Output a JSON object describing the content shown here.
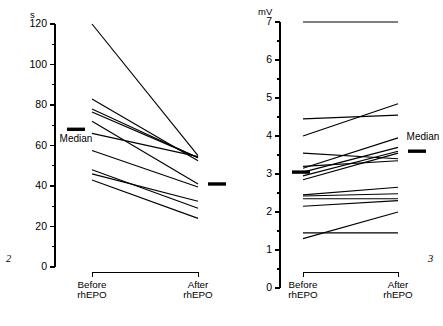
{
  "figure": {
    "panels": [
      {
        "id": "panel-left",
        "figure_number": "2",
        "unit_label": "s",
        "median_label_before": "Median",
        "median_label_after": "",
        "category_before_line1": "Before",
        "category_before_line2": "rhEPO",
        "category_after_line1": "After",
        "category_after_line2": "rhEPO"
      },
      {
        "id": "panel-right",
        "figure_number": "3",
        "unit_label": "mV",
        "median_label_before": "",
        "median_label_after": "Median",
        "category_before_line1": "Before",
        "category_before_line2": "rhEPO",
        "category_after_line1": "After",
        "category_after_line2": "rhEPO"
      }
    ]
  },
  "chart_data": [
    {
      "type": "line",
      "id": "panel-left",
      "title": "",
      "figure_number": "2",
      "xlabel": "",
      "ylabel": "s",
      "categories": [
        "Before rhEPO",
        "After rhEPO"
      ],
      "ylim": [
        0,
        120
      ],
      "yticks": [
        0,
        20,
        40,
        60,
        80,
        100,
        120
      ],
      "ytick_labels": [
        "0",
        "20",
        "40",
        "60",
        "80",
        "100",
        "120"
      ],
      "minor_tick_step": 10,
      "grid": false,
      "legend": "none",
      "series": [
        {
          "name": "subject-1",
          "values": [
            120.0,
            55.0
          ]
        },
        {
          "name": "subject-2",
          "values": [
            83.0,
            52.5
          ]
        },
        {
          "name": "subject-3",
          "values": [
            78.0,
            54.0
          ]
        },
        {
          "name": "subject-4",
          "values": [
            76.5,
            54.0
          ]
        },
        {
          "name": "subject-5",
          "values": [
            72.0,
            41.0
          ]
        },
        {
          "name": "subject-6",
          "values": [
            66.0,
            54.5
          ]
        },
        {
          "name": "subject-7",
          "values": [
            57.5,
            39.5
          ]
        },
        {
          "name": "subject-8",
          "values": [
            48.0,
            29.0
          ]
        },
        {
          "name": "subject-9",
          "values": [
            46.0,
            32.5
          ]
        },
        {
          "name": "subject-10",
          "values": [
            43.0,
            24.0
          ]
        }
      ],
      "medians": {
        "before": 68.0,
        "after": 41.0
      },
      "annotations": [
        {
          "text": "Median",
          "at": "before",
          "value": 68.0
        },
        {
          "text": "s",
          "at": "axis-unit"
        }
      ]
    },
    {
      "type": "line",
      "id": "panel-right",
      "title": "",
      "figure_number": "3",
      "xlabel": "",
      "ylabel": "mV",
      "categories": [
        "Before rhEPO",
        "After rhEPO"
      ],
      "ylim": [
        0,
        7
      ],
      "yticks": [
        0,
        1,
        2,
        3,
        4,
        5,
        6,
        7
      ],
      "ytick_labels": [
        "0",
        "1",
        "2",
        "3",
        "4",
        "5",
        "6",
        "7"
      ],
      "minor_tick_step": 0.5,
      "grid": false,
      "legend": "none",
      "series": [
        {
          "name": "subject-1",
          "values": [
            7.0,
            7.0
          ]
        },
        {
          "name": "subject-2",
          "values": [
            4.45,
            4.55
          ]
        },
        {
          "name": "subject-3",
          "values": [
            4.0,
            4.85
          ]
        },
        {
          "name": "subject-4",
          "values": [
            3.55,
            3.4
          ]
        },
        {
          "name": "subject-5",
          "values": [
            3.15,
            3.95
          ]
        },
        {
          "name": "subject-6",
          "values": [
            3.05,
            3.7
          ]
        },
        {
          "name": "subject-7",
          "values": [
            2.95,
            3.6
          ]
        },
        {
          "name": "subject-8",
          "values": [
            2.85,
            3.55
          ]
        },
        {
          "name": "subject-9",
          "values": [
            3.2,
            3.35
          ]
        },
        {
          "name": "subject-10",
          "values": [
            2.45,
            2.65
          ]
        },
        {
          "name": "subject-11",
          "values": [
            2.42,
            2.48
          ]
        },
        {
          "name": "subject-12",
          "values": [
            2.35,
            2.35
          ]
        },
        {
          "name": "subject-13",
          "values": [
            2.15,
            2.3
          ]
        },
        {
          "name": "subject-14",
          "values": [
            1.45,
            1.45
          ]
        },
        {
          "name": "subject-15",
          "values": [
            1.3,
            2.0
          ]
        }
      ],
      "medians": {
        "before": 3.05,
        "after": 3.6
      },
      "annotations": [
        {
          "text": "Median",
          "at": "after",
          "value": 3.6
        },
        {
          "text": "mV",
          "at": "axis-unit"
        }
      ]
    }
  ]
}
